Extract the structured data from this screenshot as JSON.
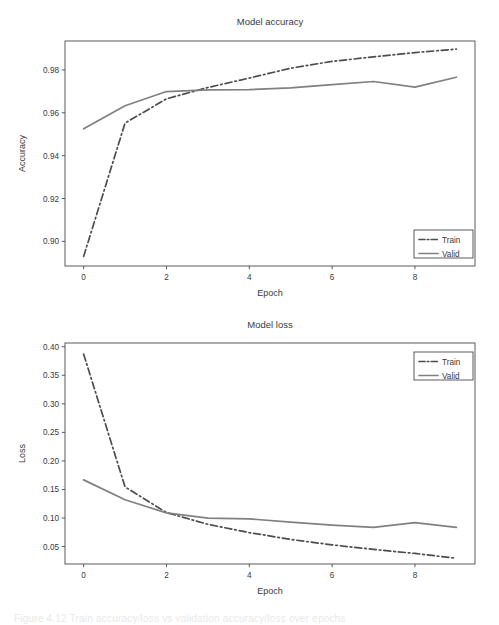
{
  "chart_data": [
    {
      "type": "line",
      "title": "Model accuracy",
      "xlabel": "Epoch",
      "ylabel": "Accuracy",
      "x": [
        0,
        1,
        2,
        3,
        4,
        5,
        6,
        7,
        8,
        9
      ],
      "xlim": [
        -0.45,
        9.45
      ],
      "ylim": [
        0.8885,
        0.9935
      ],
      "xticks": [
        0,
        2,
        4,
        6,
        8
      ],
      "xticklabels": [
        "0",
        "2",
        "4",
        "6",
        "8"
      ],
      "yticks": [
        0.9,
        0.92,
        0.94,
        0.96,
        0.98
      ],
      "yticklabels": [
        "0.90",
        "0.92",
        "0.94",
        "0.96",
        "0.98"
      ],
      "grid": false,
      "legend_position": "lower right",
      "series": [
        {
          "name": "Train",
          "style": "dashdot",
          "color": "#4d4d4d",
          "values": [
            0.893,
            0.9552,
            0.9665,
            0.9718,
            0.9762,
            0.9808,
            0.984,
            0.9861,
            0.9881,
            0.9897
          ]
        },
        {
          "name": "Valid",
          "style": "solid",
          "color": "#808080",
          "values": [
            0.9525,
            0.9633,
            0.9699,
            0.9707,
            0.9708,
            0.9716,
            0.9731,
            0.9746,
            0.972,
            0.9766
          ]
        }
      ]
    },
    {
      "type": "line",
      "title": "Model loss",
      "xlabel": "Epoch",
      "ylabel": "Loss",
      "x": [
        0,
        1,
        2,
        3,
        4,
        5,
        6,
        7,
        8,
        9
      ],
      "xlim": [
        -0.45,
        9.45
      ],
      "ylim": [
        0.0195,
        0.4065
      ],
      "xticks": [
        0,
        2,
        4,
        6,
        8
      ],
      "xticklabels": [
        "0",
        "2",
        "4",
        "6",
        "8"
      ],
      "yticks": [
        0.05,
        0.1,
        0.15,
        0.2,
        0.25,
        0.3,
        0.35,
        0.4
      ],
      "yticklabels": [
        "0.05",
        "0.10",
        "0.15",
        "0.20",
        "0.25",
        "0.30",
        "0.35",
        "0.40"
      ],
      "grid": false,
      "legend_position": "upper right",
      "series": [
        {
          "name": "Train",
          "style": "dashdot",
          "color": "#4d4d4d",
          "values": [
            0.387,
            0.1545,
            0.1095,
            0.089,
            0.0745,
            0.0625,
            0.053,
            0.045,
            0.038,
            0.0295
          ]
        },
        {
          "name": "Valid",
          "style": "solid",
          "color": "#808080",
          "values": [
            0.1668,
            0.132,
            0.109,
            0.0998,
            0.0985,
            0.093,
            0.0875,
            0.0835,
            0.092,
            0.0835
          ]
        }
      ]
    }
  ],
  "caption": {
    "text": "Figure 4.12  Train accuracy/loss vs validation accuracy/loss over epochs"
  },
  "colors": {
    "train": "#4d4d4d",
    "valid": "#808080",
    "axis": "#4a4a4a",
    "text": "#3a3a3a",
    "background": "#ffffff"
  }
}
